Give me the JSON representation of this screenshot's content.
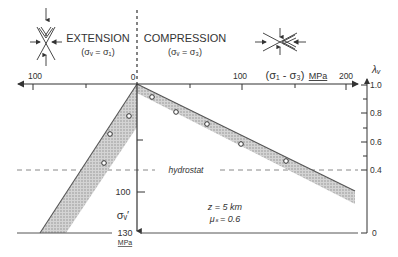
{
  "regimes": {
    "extension": {
      "title": "EXTENSION",
      "condition": "(σᵥ = σ₁)"
    },
    "compression": {
      "title": "COMPRESSION",
      "condition": "(σᵥ = σ₃)"
    }
  },
  "x_axis": {
    "label": "(σ₁ - σ₃)",
    "unit": "MPa",
    "tick_labels": {
      "left_100": "100",
      "origin": "0",
      "right_100": "100",
      "right_200": "200"
    }
  },
  "y_axis_left": {
    "label": "σᵥ′",
    "tick_labels": {
      "t100": "100",
      "t130": "130"
    },
    "unit": "MPa"
  },
  "y_axis_right": {
    "label": "λᵥ",
    "tick_labels": [
      "1.0",
      "0.8",
      "0.6",
      "0.4",
      "0"
    ]
  },
  "annotations": {
    "hydrostat": "hydrostat",
    "depth": "z = 5 km",
    "friction": "μₛ = 0.6"
  },
  "colors": {
    "line": "#555555",
    "band_fill": "#bdbdbd",
    "dash": "#888888"
  }
}
